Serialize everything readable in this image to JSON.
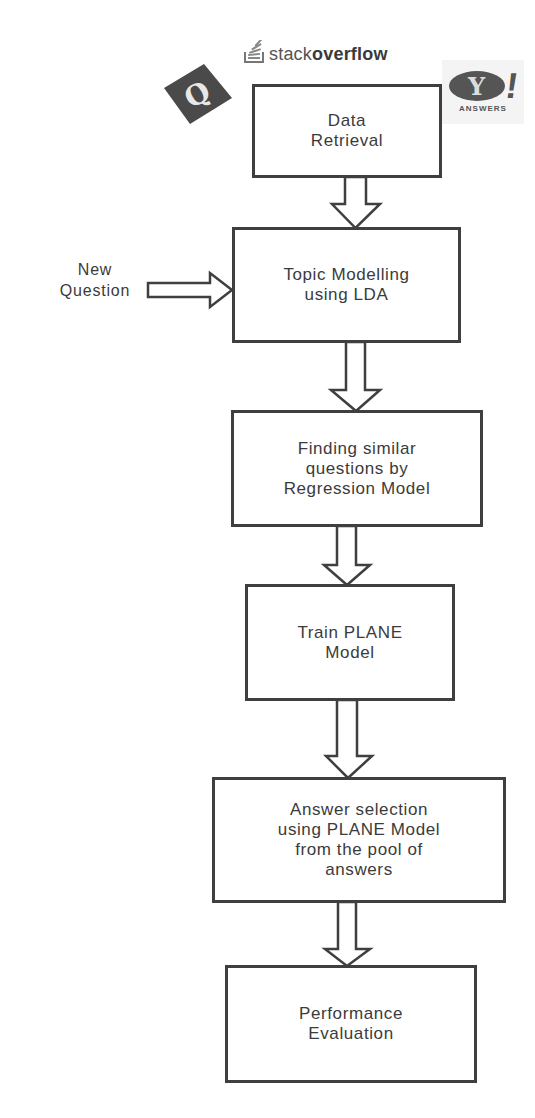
{
  "logos": {
    "quora": {
      "icon": "quora-q-icon",
      "glyph": "Q"
    },
    "stackoverflow": {
      "icon": "stackoverflow-icon",
      "text_light": "stack",
      "text_bold": "overflow"
    },
    "yahoo_answers": {
      "icon": "yahoo-answers-icon",
      "glyph": "Y",
      "bang": "!",
      "subtitle": "ANSWERS"
    }
  },
  "flowchart": {
    "input": {
      "label": "New\nQuestion",
      "target": "topic_modelling"
    },
    "steps": [
      {
        "id": "data_retrieval",
        "label": "Data\nRetrieval"
      },
      {
        "id": "topic_modelling",
        "label": "Topic Modelling\nusing LDA"
      },
      {
        "id": "finding_similar",
        "label": "Finding similar\nquestions by\nRegression Model"
      },
      {
        "id": "train_plane",
        "label": "Train PLANE\nModel"
      },
      {
        "id": "answer_selection",
        "label": "Answer selection\nusing PLANE Model\nfrom the pool of\nanswers"
      },
      {
        "id": "performance_evaluation",
        "label": "Performance\nEvaluation"
      }
    ],
    "edges": [
      [
        "data_retrieval",
        "topic_modelling"
      ],
      [
        "topic_modelling",
        "finding_similar"
      ],
      [
        "finding_similar",
        "train_plane"
      ],
      [
        "train_plane",
        "answer_selection"
      ],
      [
        "answer_selection",
        "performance_evaluation"
      ]
    ]
  },
  "colors": {
    "stroke": "#3f3f3f",
    "text": "#3b3b3b",
    "background": "#ffffff"
  }
}
